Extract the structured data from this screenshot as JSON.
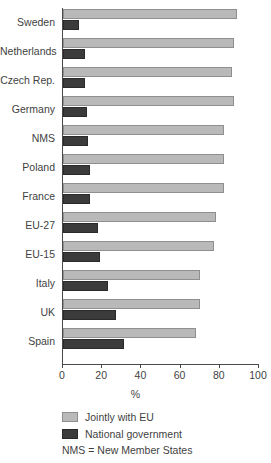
{
  "chart_data": {
    "type": "bar",
    "orientation": "horizontal",
    "title": "",
    "xlabel": "%",
    "ylabel": "",
    "xlim": [
      0,
      100
    ],
    "xticks": [
      0,
      20,
      40,
      60,
      80,
      100
    ],
    "grid": false,
    "legend_position": "bottom-left",
    "categories": [
      "Sweden",
      "Netherlands",
      "Czech Rep.",
      "Germany",
      "NMS",
      "Poland",
      "France",
      "EU-27",
      "EU-15",
      "Italy",
      "UK",
      "Spain"
    ],
    "series": [
      {
        "name": "Jointly with EU",
        "color": "#b9b9b9",
        "values": [
          89,
          87,
          86,
          87,
          82,
          82,
          82,
          78,
          77,
          70,
          70,
          68
        ]
      },
      {
        "name": "National government",
        "color": "#3b3b3b",
        "values": [
          8,
          11,
          11,
          12,
          13,
          14,
          14,
          18,
          19,
          23,
          27,
          31
        ]
      }
    ],
    "annotations": [
      "NMS = New Member States"
    ]
  },
  "axis": {
    "x_title": "%",
    "tick_labels": [
      "0",
      "20",
      "40",
      "60",
      "80",
      "100"
    ]
  },
  "legend": {
    "items": [
      {
        "label": "Jointly with EU"
      },
      {
        "label": "National government"
      }
    ],
    "note": "NMS = New Member States"
  }
}
